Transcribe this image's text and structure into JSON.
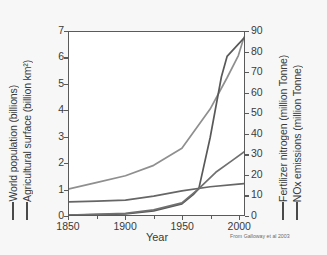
{
  "chart_data": {
    "type": "line",
    "title": "",
    "xlabel": "Year",
    "credit": "From Galloway et al 2003",
    "xlim": [
      1850,
      2005
    ],
    "xticks": [
      1850,
      1900,
      1950,
      2000
    ],
    "xminor": [
      1875,
      1925,
      1975
    ],
    "left_axis": {
      "titles": [
        "World population (billions)",
        "Agricultural surface (billion km²)"
      ],
      "ylim": [
        0,
        7
      ],
      "yticks": [
        0,
        1,
        2,
        3,
        4,
        5,
        6,
        7
      ]
    },
    "right_axis": {
      "titles": [
        "Fertilizer nitrogen (million Tonne)",
        "NOx emissions (million Tonne)"
      ],
      "ylim": [
        0,
        90
      ],
      "yticks": [
        0,
        10,
        20,
        30,
        40,
        50,
        60,
        70,
        80,
        90
      ]
    },
    "grid": false,
    "legend": "axis-title-dashes",
    "series": [
      {
        "name": "World population (billions)",
        "axis": "left",
        "unit": "billions",
        "color": "#8f8f8f",
        "x": [
          1850,
          1875,
          1900,
          1925,
          1950,
          1975,
          1990,
          2000,
          2005
        ],
        "values": [
          1.0,
          1.25,
          1.5,
          1.9,
          2.55,
          4.05,
          5.25,
          6.1,
          6.8
        ]
      },
      {
        "name": "Agricultural surface (billion km²)",
        "axis": "left",
        "unit": "billion km2",
        "color": "#666666",
        "x": [
          1850,
          1875,
          1900,
          1925,
          1950,
          1975,
          2000,
          2005
        ],
        "values": [
          0.5,
          0.53,
          0.57,
          0.72,
          0.92,
          1.08,
          1.18,
          1.2
        ]
      },
      {
        "name": "Fertilizer nitrogen (million Tonne)",
        "axis": "right",
        "unit": "million Tonne",
        "color": "#595959",
        "x": [
          1850,
          1900,
          1925,
          1950,
          1960,
          1965,
          1975,
          1985,
          1990,
          2000,
          2005
        ],
        "values": [
          0,
          0.5,
          2,
          5.5,
          10,
          13,
          38,
          68,
          78,
          84,
          87
        ]
      },
      {
        "name": "NOx emissions (million Tonne)",
        "axis": "right",
        "unit": "million Tonne",
        "color": "#707070",
        "x": [
          1850,
          1900,
          1925,
          1950,
          1965,
          1980,
          1995,
          2005
        ],
        "values": [
          0,
          0.8,
          2.5,
          6,
          13,
          21,
          27,
          31
        ]
      }
    ]
  }
}
